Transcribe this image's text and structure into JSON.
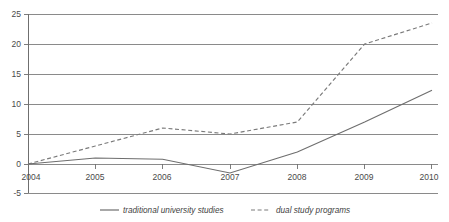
{
  "chart_data": {
    "type": "line",
    "title": "",
    "xlabel": "",
    "ylabel": "",
    "x": [
      2004,
      2005,
      2006,
      2007,
      2008,
      2009,
      2010
    ],
    "xtick_labels": [
      "2004",
      "2005",
      "2006",
      "2007",
      "2008",
      "2009",
      "2010"
    ],
    "ytick_labels": [
      "25",
      "20",
      "15",
      "10",
      "5",
      "0",
      "-5"
    ],
    "yticks": [
      25,
      20,
      15,
      10,
      5,
      0,
      -5
    ],
    "ylim": [
      -5,
      25
    ],
    "xlim": [
      2004,
      2010
    ],
    "grid": true,
    "legend_position": "bottom",
    "series": [
      {
        "name": "traditional university studies",
        "style": "solid",
        "color": "#6e6e6e",
        "values": [
          0,
          1,
          0.8,
          -1.5,
          2,
          7,
          12.3
        ]
      },
      {
        "name": "dual study programs",
        "style": "dashed",
        "color": "#7a7a7a",
        "values": [
          0,
          3,
          6,
          5,
          7,
          20,
          23.5
        ]
      }
    ]
  },
  "axis": {
    "y_labels": [
      "25",
      "20",
      "15",
      "10",
      "5",
      "0",
      "-5"
    ],
    "x_labels": [
      "2004",
      "2005",
      "2006",
      "2007",
      "2008",
      "2009",
      "2010"
    ]
  },
  "legend": {
    "items": [
      {
        "label": "traditional university studies",
        "marker": "solid-line-icon"
      },
      {
        "label": "dual study programs",
        "marker": "dashed-line-icon"
      }
    ]
  }
}
